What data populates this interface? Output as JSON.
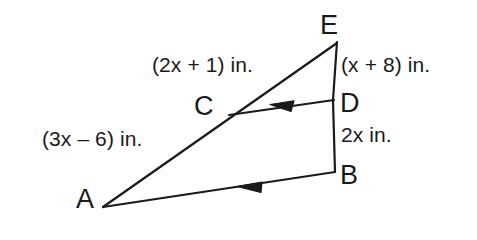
{
  "figure": {
    "background_color": "#ffffff",
    "stroke_color": "#1a1a1a",
    "stroke_width": 2.2
  },
  "vertices": [
    {
      "id": "E",
      "label": "E",
      "x": 337,
      "y": 41
    },
    {
      "id": "C",
      "label": "C",
      "x": 229,
      "y": 114
    },
    {
      "id": "D",
      "label": "D",
      "x": 333,
      "y": 100
    },
    {
      "id": "B",
      "label": "B",
      "x": 335,
      "y": 172
    },
    {
      "id": "A",
      "label": "A",
      "x": 103,
      "y": 207
    }
  ],
  "segments": [
    {
      "id": "EA",
      "from": "E",
      "to": "A",
      "measure": "(2x + 1) in."
    },
    {
      "id": "ED",
      "from": "E",
      "to": "D",
      "measure": "(x + 8) in."
    },
    {
      "id": "DB",
      "from": "D",
      "to": "B",
      "measure": "2x in."
    },
    {
      "id": "CD",
      "from": "C",
      "to": "D",
      "measure": "",
      "arrow": "single-left"
    },
    {
      "id": "AB",
      "from": "A",
      "to": "B",
      "measure": "",
      "arrow": "single-left"
    }
  ],
  "measures": {
    "segment_ec": "(2x + 1) in.",
    "segment_ed": "(x + 8) in.",
    "segment_ca": "(3x – 6) in.",
    "segment_db": "2x in."
  },
  "arrow_marks": [
    {
      "id": "arrow-cd",
      "on_segment": "CD",
      "direction": "left",
      "tip_x": 272,
      "tip_y": 104
    },
    {
      "id": "arrow-ab",
      "on_segment": "AB",
      "direction": "left",
      "tip_x": 239,
      "tip_y": 185
    }
  ]
}
